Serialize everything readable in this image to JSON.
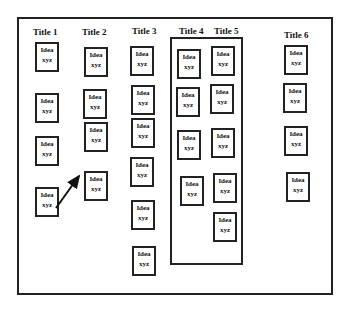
{
  "titles": [
    {
      "label": "Title 1",
      "x": 33,
      "y": 27
    },
    {
      "label": "Title 2",
      "x": 82,
      "y": 27
    },
    {
      "label": "Title 3",
      "x": 132,
      "y": 26
    },
    {
      "label": "Title 4",
      "x": 179,
      "y": 26
    },
    {
      "label": "Title 5",
      "x": 214,
      "y": 26
    },
    {
      "label": "Title 6",
      "x": 284,
      "y": 30
    }
  ],
  "card_text": {
    "line1": "Idea",
    "line2": "xyz"
  },
  "cards": [
    {
      "column": "Title 1",
      "x": 35,
      "y": 42
    },
    {
      "column": "Title 1",
      "x": 35,
      "y": 93
    },
    {
      "column": "Title 1",
      "x": 35,
      "y": 136
    },
    {
      "column": "Title 1",
      "x": 35,
      "y": 187
    },
    {
      "column": "Title 2",
      "x": 84,
      "y": 47
    },
    {
      "column": "Title 2",
      "x": 83,
      "y": 89
    },
    {
      "column": "Title 2",
      "x": 84,
      "y": 122
    },
    {
      "column": "Title 2",
      "x": 84,
      "y": 171
    },
    {
      "column": "Title 3",
      "x": 130,
      "y": 46
    },
    {
      "column": "Title 3",
      "x": 131,
      "y": 85
    },
    {
      "column": "Title 3",
      "x": 131,
      "y": 118
    },
    {
      "column": "Title 3",
      "x": 130,
      "y": 157
    },
    {
      "column": "Title 3",
      "x": 131,
      "y": 200
    },
    {
      "column": "Title 3",
      "x": 132,
      "y": 246
    },
    {
      "column": "Title 4",
      "x": 177,
      "y": 49
    },
    {
      "column": "Title 4",
      "x": 176,
      "y": 87
    },
    {
      "column": "Title 4",
      "x": 177,
      "y": 130
    },
    {
      "column": "Title 4",
      "x": 180,
      "y": 176
    },
    {
      "column": "Title 5",
      "x": 211,
      "y": 46
    },
    {
      "column": "Title 5",
      "x": 210,
      "y": 84
    },
    {
      "column": "Title 5",
      "x": 211,
      "y": 128
    },
    {
      "column": "Title 5",
      "x": 213,
      "y": 173
    },
    {
      "column": "Title 5",
      "x": 213,
      "y": 212
    },
    {
      "column": "Title 6",
      "x": 284,
      "y": 45
    },
    {
      "column": "Title 6",
      "x": 283,
      "y": 83
    },
    {
      "column": "Title 6",
      "x": 284,
      "y": 126
    },
    {
      "column": "Title 6",
      "x": 286,
      "y": 172
    }
  ],
  "arrow": {
    "from": [
      56,
      208
    ],
    "to": [
      79,
      176
    ]
  }
}
